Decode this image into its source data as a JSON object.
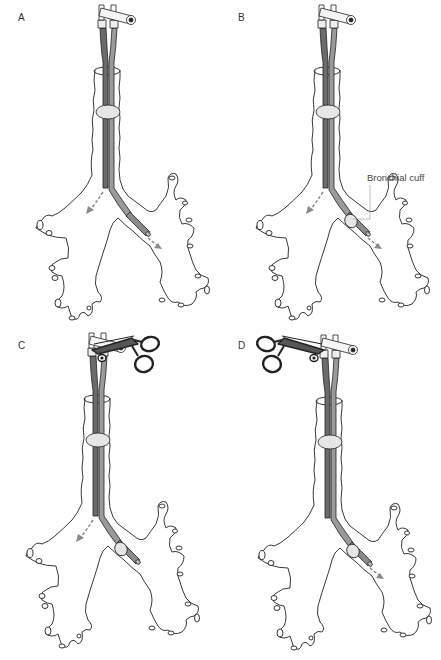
{
  "figure": {
    "panels": [
      {
        "id": "A",
        "label": "A",
        "clamp": "none",
        "bronchial_cuff": false,
        "flow": [
          "left",
          "right"
        ]
      },
      {
        "id": "B",
        "label": "B",
        "clamp": "none",
        "bronchial_cuff": true,
        "flow": [
          "left",
          "right"
        ],
        "annotation": "Bronchial cuff"
      },
      {
        "id": "C",
        "label": "C",
        "clamp": "right",
        "bronchial_cuff": true,
        "flow": [
          "left"
        ]
      },
      {
        "id": "D",
        "label": "D",
        "clamp": "left",
        "bronchial_cuff": true,
        "flow": [
          "right"
        ]
      }
    ],
    "colors": {
      "tube_dark": "#6b6b6b",
      "tube_light": "#9a9a9a",
      "outline": "#222222",
      "cuff_fill": "#e6e6e6",
      "arrow": "#8a8a8a",
      "leader": "#aaaaaa"
    }
  }
}
